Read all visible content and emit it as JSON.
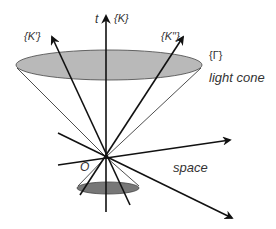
{
  "diagram": {
    "type": "spacetime light cone diagram",
    "labels": {
      "time_axis": "t",
      "frame_K": "{K}",
      "frame_K_prime": "{K′}",
      "frame_K_double_prime": "{K′′}",
      "gamma": "{Γ}",
      "light_cone": "light cone",
      "origin": "O",
      "space": "space"
    },
    "colors": {
      "stroke": "#111111",
      "upper_ellipse_fill": "#b9b9b9",
      "lower_ellipse_fill": "#777777",
      "cone_line": "#222222",
      "background": "#ffffff"
    },
    "geometry": {
      "origin": [
        106,
        157
      ],
      "upper_ellipse": {
        "cx": 109,
        "cy": 65,
        "rx": 93,
        "ry": 15
      },
      "lower_ellipse": {
        "cx": 108,
        "cy": 188,
        "rx": 31,
        "ry": 6
      }
    }
  }
}
